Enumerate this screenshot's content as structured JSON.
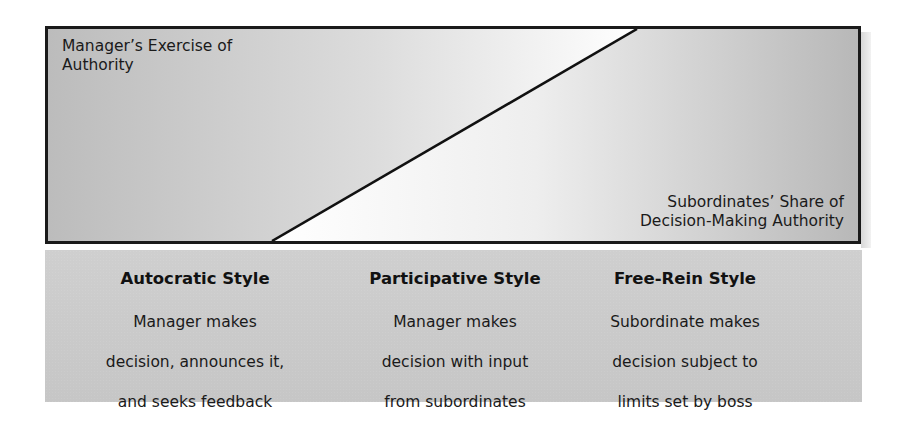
{
  "diagram": {
    "top_box": {
      "left_label": "Manager’s Exercise of\nAuthority",
      "left_label_line1": "Manager’s Exercise of",
      "left_label_line2": "Authority",
      "right_label_line1": "Subordinates’ Share of",
      "right_label_line2": "Decision-Making Authority",
      "colors": {
        "border": "#1a1a1a",
        "gray": "#bdbdbd",
        "white": "#ffffff",
        "diagonal": "#111111"
      }
    },
    "styles": [
      {
        "title": "Autocratic Style",
        "desc_line1": "Manager makes",
        "desc_line2": "decision, announces it,",
        "desc_line3": "and seeks feedback"
      },
      {
        "title": "Participative Style",
        "desc_line1": "Manager makes",
        "desc_line2": "decision with input",
        "desc_line3": "from subordinates"
      },
      {
        "title": "Free-Rein Style",
        "desc_line1": "Subordinate makes",
        "desc_line2": "decision subject to",
        "desc_line3": "limits set by boss"
      }
    ],
    "bottom_panel_color": "#c9c9c9"
  }
}
